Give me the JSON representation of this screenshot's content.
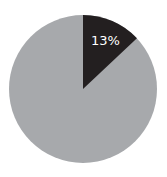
{
  "chart_data": {
    "type": "pie",
    "categories": [
      "Highlighted",
      "Remainder"
    ],
    "values": [
      13,
      87
    ],
    "labels": [
      "13%",
      ""
    ],
    "colors": [
      "#231f20",
      "#a7a9ac"
    ],
    "title": "",
    "legend": "none"
  },
  "label": {
    "highlight": "13%"
  }
}
